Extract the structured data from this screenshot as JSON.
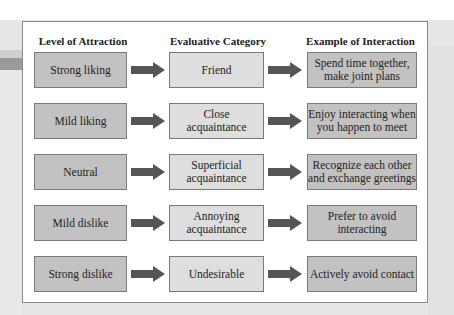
{
  "headers": [
    "Level of Attraction",
    "Evaluative Category",
    "Example of Interaction"
  ],
  "rows": [
    {
      "level": "Strong liking",
      "category": "Friend",
      "example": "Spend time together,\nmake joint plans"
    },
    {
      "level": "Mild liking",
      "category": "Close\nacquaintance",
      "example": "Enjoy interacting when\nyou happen to meet"
    },
    {
      "level": "Neutral",
      "category": "Superficial\nacquaintance",
      "example": "Recognize each other\nand exchange greetings"
    },
    {
      "level": "Mild dislike",
      "category": "Annoying\nacquaintance",
      "example": "Prefer to avoid\ninteracting"
    },
    {
      "level": "Strong dislike",
      "category": "Undesirable",
      "example": "Actively avoid contact"
    }
  ],
  "colors": {
    "level_box": "#c2c2c2",
    "category_box": "#dedede",
    "example_box": "#c2c2c2",
    "arrow": "#555555"
  }
}
